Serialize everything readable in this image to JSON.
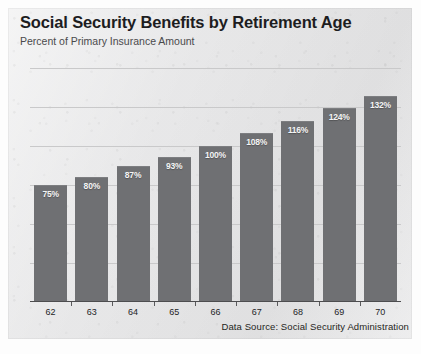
{
  "chart_data": {
    "type": "bar",
    "title": "Social Security Benefits by Retirement Age",
    "subtitle": "Percent of Primary Insurance Amount",
    "xlabel": "",
    "ylabel": "",
    "categories": [
      "62",
      "63",
      "64",
      "65",
      "66",
      "67",
      "68",
      "69",
      "70"
    ],
    "values": [
      75,
      80,
      87,
      93,
      100,
      108,
      116,
      124,
      132
    ],
    "value_labels": [
      "75%",
      "80%",
      "87%",
      "93%",
      "100%",
      "108%",
      "116%",
      "124%",
      "132%"
    ],
    "ylim": [
      0,
      155
    ],
    "gridlines": [
      0,
      25,
      50,
      75,
      100,
      125,
      150
    ],
    "grid": true,
    "legend": null,
    "source_note": "Data Source: Social Security Administration",
    "bar_color": "#6f7073",
    "label_color": "#f4f4f4",
    "grid_color": "#c9c9ca",
    "axis_color": "#4d4d4f",
    "panel_color": "#ececed",
    "title_color": "#1d1d1f",
    "subtitle_color": "#4a4a4c"
  }
}
